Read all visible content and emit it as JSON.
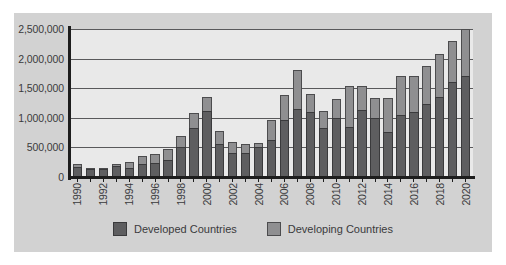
{
  "chart_data": {
    "type": "bar",
    "stacked": true,
    "title": "",
    "xlabel": "",
    "ylabel": "",
    "ylim": [
      0,
      2500000
    ],
    "ytick_labels": [
      "2,500,000",
      "2,000,000",
      "1,500,000",
      "1,000,000",
      "500,000",
      "0"
    ],
    "ytick_values": [
      2500000,
      2000000,
      1500000,
      1000000,
      500000,
      0
    ],
    "grid": true,
    "legend_position": "bottom",
    "x": [
      1990,
      1991,
      1992,
      1993,
      1994,
      1995,
      1996,
      1997,
      1998,
      1999,
      2000,
      2001,
      2002,
      2003,
      2004,
      2005,
      2006,
      2007,
      2008,
      2009,
      2010,
      2011,
      2012,
      2013,
      2014,
      2015,
      2016,
      2017,
      2018,
      2019,
      2020
    ],
    "categories": [
      "1990",
      "1991",
      "1992",
      "1993",
      "1994",
      "1995",
      "1996",
      "1997",
      "1998",
      "1999",
      "2000",
      "2001",
      "2002",
      "2003",
      "2004",
      "2005",
      "2006",
      "2007",
      "2008",
      "2009",
      "2010",
      "2011",
      "2012",
      "2013",
      "2014",
      "2015",
      "2016",
      "2017",
      "2018",
      "2019",
      "2020"
    ],
    "visible_tick_labels": [
      "1990",
      "1992",
      "1994",
      "1996",
      "1998",
      "2000",
      "2002",
      "2004",
      "2006",
      "2008",
      "2010",
      "2012",
      "2014",
      "2016",
      "2018",
      "2020"
    ],
    "series": [
      {
        "name": "Developed Countries",
        "color": "#5e5e60",
        "values": [
          170000,
          130000,
          130000,
          180000,
          150000,
          220000,
          230000,
          280000,
          500000,
          830000,
          1120000,
          560000,
          410000,
          400000,
          500000,
          620000,
          970000,
          1150000,
          1090000,
          830000,
          1000000,
          850000,
          1140000,
          990000,
          760000,
          1050000,
          1090000,
          1240000,
          1350000,
          1600000,
          1710000
        ]
      },
      {
        "name": "Developing Countries",
        "color": "#8f8f91",
        "values": [
          50000,
          20000,
          30000,
          40000,
          110000,
          130000,
          160000,
          200000,
          190000,
          250000,
          240000,
          210000,
          180000,
          150000,
          80000,
          340000,
          420000,
          660000,
          310000,
          280000,
          310000,
          690000,
          400000,
          340000,
          580000,
          660000,
          620000,
          630000,
          730000,
          700000,
          790000
        ]
      }
    ],
    "totals": [
      220000,
      150000,
      160000,
      220000,
      260000,
      350000,
      390000,
      480000,
      690000,
      1080000,
      1360000,
      770000,
      590000,
      550000,
      580000,
      960000,
      1390000,
      1810000,
      1400000,
      1110000,
      1310000,
      1540000,
      1540000,
      1330000,
      1340000,
      1710000,
      1710000,
      1870000,
      2080000,
      2300000,
      2500000
    ]
  },
  "legend": {
    "items": [
      {
        "label": "Developed Countries",
        "swatch": "legend-swatch-developed"
      },
      {
        "label": "Developing Countries",
        "swatch": "legend-swatch-developing"
      }
    ]
  },
  "colors": {
    "panel_background": "#d2d2d2",
    "plot_background": "#e9e9e9",
    "axis": "#1d1d1d",
    "gridline": "#59595b",
    "text": "#3a3a3c",
    "developed": "#5e5e60",
    "developing": "#8f8f91"
  }
}
